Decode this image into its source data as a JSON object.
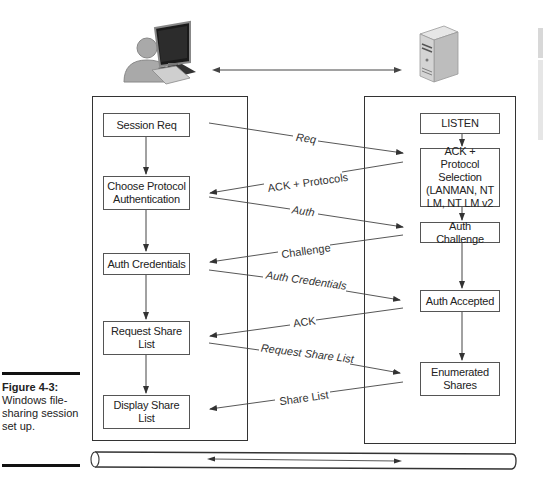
{
  "figure": {
    "number": "Figure 4-3:",
    "caption": "Windows file-sharing session set up."
  },
  "icons": {
    "client": "user-at-computer-icon",
    "server": "server-tower-icon",
    "network": "network-cable-icon"
  },
  "client_column": {
    "boxes": [
      {
        "id": "session-req",
        "label": "Session Req"
      },
      {
        "id": "choose-protocol",
        "label": "Choose Protocol Authentication"
      },
      {
        "id": "auth-credentials",
        "label": "Auth Credentials"
      },
      {
        "id": "request-share-list",
        "label": "Request Share List"
      },
      {
        "id": "display-share-list",
        "label": "Display Share List"
      }
    ]
  },
  "server_column": {
    "boxes": [
      {
        "id": "listen",
        "label": "LISTEN"
      },
      {
        "id": "ack-protocol",
        "label": "ACK + Protocol Selection (LANMAN, NT LM, NT LM v2"
      },
      {
        "id": "auth-challenge",
        "label": "Auth Challenge"
      },
      {
        "id": "auth-accepted",
        "label": "Auth Accepted"
      },
      {
        "id": "enumerated-shares",
        "label": "Enumerated Shares"
      }
    ]
  },
  "messages": [
    {
      "label": "Req",
      "direction": "client-to-server"
    },
    {
      "label": "ACK + Protocols",
      "direction": "server-to-client"
    },
    {
      "label": "Auth",
      "direction": "client-to-server"
    },
    {
      "label": "Challenge",
      "direction": "server-to-client"
    },
    {
      "label": "Auth Credentials",
      "direction": "client-to-server"
    },
    {
      "label": "ACK",
      "direction": "server-to-client"
    },
    {
      "label": "Request Share List",
      "direction": "client-to-server"
    },
    {
      "label": "Share List",
      "direction": "server-to-client"
    }
  ]
}
